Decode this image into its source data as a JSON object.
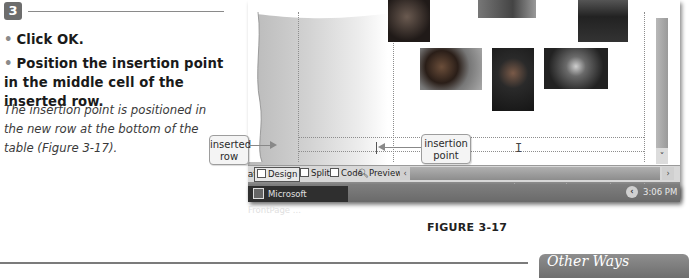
{
  "step": {
    "number": "3",
    "bullets": [
      "Click OK.",
      "Position the insertion point in the middle cell of the inserted row."
    ],
    "result_text": "The insertion point is positioned in the new row at the bottom of the table (Figure 3-17)."
  },
  "screenshot": {
    "view_tabs": {
      "navigation": "gation",
      "design": "Design",
      "split": "Split",
      "code": "Code",
      "preview": "Preview"
    },
    "status_bar": {
      "download_time": "0:35@56Kbps",
      "page_size": "626 x 375",
      "doctype": "Default",
      "css": "Custom"
    },
    "taskbar": {
      "app_button": "Microsoft FrontPage ...",
      "clock": "3:06 PM",
      "tray_toggle": "‹"
    },
    "scroll": {
      "down_arrow": "˅",
      "left_arrow": "‹",
      "right_arrow": "›"
    }
  },
  "callouts": {
    "inserted_row": "inserted row",
    "insertion_point": "insertion point"
  },
  "figure_caption": "FIGURE 3-17",
  "sidebar": {
    "other_ways_title": "Other Ways"
  },
  "colors": {
    "step_badge": "#6d6d6d",
    "other_ways_bg": "#7e7e7e"
  }
}
